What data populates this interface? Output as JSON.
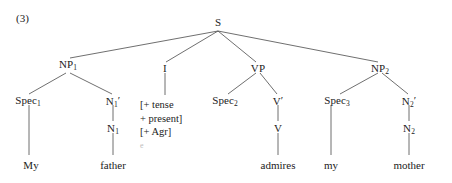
{
  "figure": {
    "example_number": "(3)",
    "type": "syntax-tree",
    "sentence": "My father admires my mother",
    "line_color": "#4a4a4a",
    "text_color": "#222222",
    "background": "#ffffff"
  },
  "nodes": {
    "s": {
      "label": "S",
      "x": 218,
      "y": 22
    },
    "np1": {
      "label": "NP",
      "sub": "1",
      "x": 68,
      "y": 64
    },
    "infl": {
      "label": "I",
      "x": 165,
      "y": 68
    },
    "vp": {
      "label": "VP",
      "x": 258,
      "y": 68
    },
    "np2": {
      "label": "NP",
      "sub": "2",
      "x": 380,
      "y": 68
    },
    "spec1": {
      "label": "Spec",
      "sub": "1",
      "x": 28,
      "y": 100
    },
    "nbar1": {
      "label": "N",
      "sub": "1",
      "prime": "′",
      "x": 113,
      "y": 100
    },
    "n1": {
      "label": "N",
      "sub": "1",
      "x": 113,
      "y": 128
    },
    "spec2": {
      "label": "Spec",
      "sub": "2",
      "x": 225,
      "y": 100
    },
    "vbar": {
      "label": "V",
      "prime": "′",
      "x": 278,
      "y": 100
    },
    "v": {
      "label": "V",
      "x": 278,
      "y": 128
    },
    "spec3": {
      "label": "Spec",
      "sub": "3",
      "x": 337,
      "y": 100
    },
    "nbar2": {
      "label": "N",
      "sub": "2",
      "prime": "′",
      "x": 409,
      "y": 100
    },
    "n2": {
      "label": "N",
      "sub": "2",
      "x": 409,
      "y": 128
    }
  },
  "infl_features": {
    "line1": "[+ tense",
    "line2": "+ present]",
    "line3": "[+ Agr]",
    "line4": "e"
  },
  "leaves": {
    "my_determiner": {
      "text": "My",
      "x": 31,
      "y": 165
    },
    "father_noun": {
      "text": "father",
      "x": 113,
      "y": 165
    },
    "admires_verb": {
      "text": "admires",
      "x": 278,
      "y": 165
    },
    "my_determiner2": {
      "text": "my",
      "x": 331,
      "y": 165
    },
    "mother_noun": {
      "text": "mother",
      "x": 409,
      "y": 165
    }
  },
  "edges": [
    {
      "from": "s",
      "to": "np1"
    },
    {
      "from": "s",
      "to": "infl"
    },
    {
      "from": "s",
      "to": "vp"
    },
    {
      "from": "s",
      "to": "np2"
    },
    {
      "from": "np1",
      "to": "spec1"
    },
    {
      "from": "np1",
      "to": "nbar1"
    },
    {
      "from": "nbar1",
      "to": "n1"
    },
    {
      "from": "n1",
      "to": "father_noun"
    },
    {
      "from": "spec1",
      "to": "my_determiner"
    },
    {
      "from": "infl",
      "to": "infl_features"
    },
    {
      "from": "vp",
      "to": "spec2"
    },
    {
      "from": "vp",
      "to": "vbar"
    },
    {
      "from": "vbar",
      "to": "v"
    },
    {
      "from": "v",
      "to": "admires_verb"
    },
    {
      "from": "np2",
      "to": "spec3"
    },
    {
      "from": "np2",
      "to": "nbar2"
    },
    {
      "from": "spec3",
      "to": "my_determiner2"
    },
    {
      "from": "nbar2",
      "to": "n2"
    },
    {
      "from": "n2",
      "to": "mother_noun"
    }
  ]
}
